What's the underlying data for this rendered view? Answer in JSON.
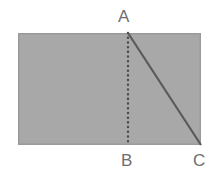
{
  "figure": {
    "kind": "plane-geometry-diagram",
    "canvas": {
      "width": 214,
      "height": 180,
      "background": "#ffffff"
    },
    "shape": {
      "name": "rectangle",
      "x": 18,
      "y": 33,
      "width": 183,
      "height": 112,
      "fill": "#a8a8a8",
      "stroke": "#9a9a9a",
      "stroke_width": 1.5
    },
    "points": {
      "A": {
        "x": 128,
        "y": 33
      },
      "B": {
        "x": 128,
        "y": 145
      },
      "C": {
        "x": 201,
        "y": 145
      }
    },
    "segments": [
      {
        "name": "segment-AB",
        "from": "A",
        "to": "B",
        "style": "dotted",
        "color": "#4a4a4a",
        "stroke_width": 2.4,
        "dash": "0.1 4.6"
      },
      {
        "name": "segment-AC",
        "from": "A",
        "to": "C",
        "style": "solid",
        "color": "#5a5a5a",
        "stroke_width": 2.2
      }
    ],
    "labels": {
      "a": "A",
      "b": "B",
      "c": "C",
      "color": "#6e6e6e",
      "font_size": 17
    }
  }
}
